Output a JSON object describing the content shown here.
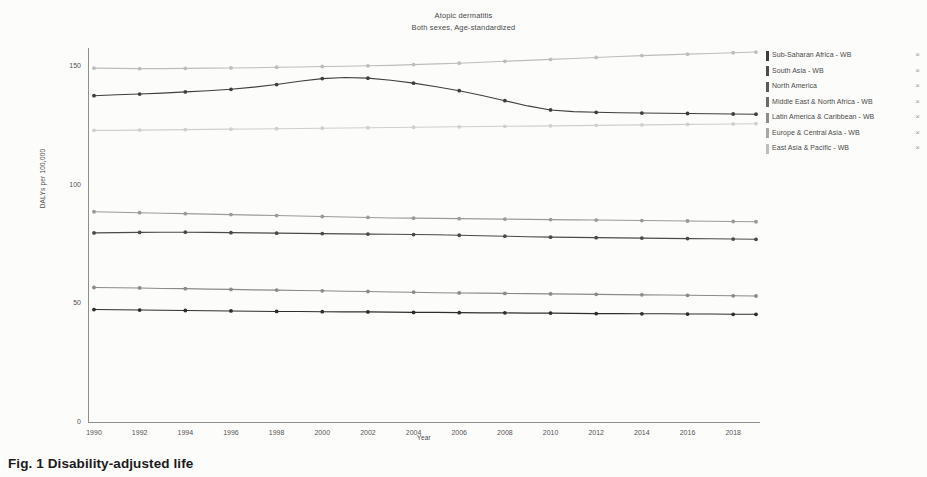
{
  "figure": {
    "title": "Atopic dermatitis",
    "subtitle": "Both sexes, Age-standardized",
    "caption": "Fig. 1  Disability-adjusted life"
  },
  "axes": {
    "y_label": "DALYs per 100,000",
    "x_label": "Year",
    "y_ticks": [
      "0",
      "50",
      "100",
      "150"
    ],
    "x_ticks": [
      "1990",
      "1992",
      "1994",
      "1996",
      "1998",
      "2000",
      "2002",
      "2004",
      "2006",
      "2008",
      "2010",
      "2012",
      "2014",
      "2016",
      "2018"
    ]
  },
  "legend": {
    "items": [
      {
        "label": "Sub-Saharan Africa - WB",
        "color": "#3f3f3f",
        "close": "×"
      },
      {
        "label": "South Asia - WB",
        "color": "#4d4d4d",
        "close": "×"
      },
      {
        "label": "North America",
        "color": "#5a5a5a",
        "close": "×"
      },
      {
        "label": "Middle East & North Africa - WB",
        "color": "#6b6b6b",
        "close": "×"
      },
      {
        "label": "Latin America & Caribbean - WB",
        "color": "#8c8c8c",
        "close": "×"
      },
      {
        "label": "Europe & Central Asia - WB",
        "color": "#a8a8a8",
        "close": "×"
      },
      {
        "label": "East Asia & Pacific - WB",
        "color": "#bdbdbd",
        "close": "×"
      }
    ]
  },
  "chart_data": {
    "type": "line",
    "title": "Atopic dermatitis",
    "subtitle": "Both sexes, Age-standardized",
    "xlabel": "Year",
    "ylabel": "DALYs per 100,000",
    "xlim": [
      1990,
      2019
    ],
    "ylim": [
      0,
      158
    ],
    "y_ticks": [
      0,
      50,
      100,
      150
    ],
    "x_ticks": [
      1990,
      1992,
      1994,
      1996,
      1998,
      2000,
      2002,
      2004,
      2006,
      2008,
      2010,
      2012,
      2014,
      2016,
      2018
    ],
    "grid": false,
    "legend_position": "right",
    "x": [
      1990,
      1991,
      1992,
      1993,
      1994,
      1995,
      1996,
      1997,
      1998,
      1999,
      2000,
      2001,
      2002,
      2003,
      2004,
      2005,
      2006,
      2007,
      2008,
      2009,
      2010,
      2011,
      2012,
      2013,
      2014,
      2015,
      2016,
      2017,
      2018,
      2019
    ],
    "series": [
      {
        "name": "East Asia & Pacific - WB",
        "color": "#bdbdbd",
        "values": [
          149.5,
          149.4,
          149.3,
          149.3,
          149.4,
          149.5,
          149.6,
          149.7,
          149.9,
          150.0,
          150.2,
          150.3,
          150.5,
          150.7,
          151.0,
          151.3,
          151.6,
          152.0,
          152.4,
          152.8,
          153.2,
          153.6,
          154.0,
          154.4,
          154.8,
          155.1,
          155.4,
          155.7,
          156.0,
          156.3
        ]
      },
      {
        "name": "Sub-Saharan Africa - WB",
        "color": "#3f3f3f",
        "values": [
          137.9,
          138.3,
          138.6,
          139.0,
          139.5,
          140.0,
          140.6,
          141.5,
          142.6,
          144.0,
          145.1,
          145.6,
          145.3,
          144.4,
          143.2,
          141.7,
          140.0,
          138.0,
          135.8,
          133.6,
          131.9,
          131.2,
          130.9,
          130.7,
          130.6,
          130.5,
          130.4,
          130.3,
          130.2,
          130.1
        ]
      },
      {
        "name": "Europe & Central Asia - WB",
        "color": "#cfcfcf",
        "values": [
          123.3,
          123.3,
          123.4,
          123.5,
          123.6,
          123.7,
          123.8,
          123.9,
          124.0,
          124.1,
          124.2,
          124.3,
          124.4,
          124.5,
          124.6,
          124.7,
          124.8,
          124.9,
          125.0,
          125.1,
          125.2,
          125.3,
          125.4,
          125.5,
          125.6,
          125.7,
          125.8,
          125.9,
          126.0,
          126.1
        ]
      },
      {
        "name": "Latin America & Caribbean - WB",
        "color": "#9a9a9a",
        "values": [
          89.0,
          88.8,
          88.6,
          88.4,
          88.2,
          88.0,
          87.8,
          87.6,
          87.4,
          87.2,
          87.0,
          86.8,
          86.6,
          86.4,
          86.3,
          86.2,
          86.1,
          86.0,
          85.9,
          85.8,
          85.7,
          85.6,
          85.5,
          85.4,
          85.3,
          85.2,
          85.1,
          85.0,
          84.9,
          84.8
        ]
      },
      {
        "name": "Middle East & North Africa - WB",
        "color": "#4a4a4a",
        "values": [
          80.1,
          80.2,
          80.3,
          80.4,
          80.4,
          80.3,
          80.2,
          80.1,
          80.0,
          79.9,
          79.8,
          79.7,
          79.6,
          79.5,
          79.4,
          79.3,
          79.1,
          78.9,
          78.7,
          78.5,
          78.3,
          78.2,
          78.1,
          78.0,
          77.9,
          77.8,
          77.7,
          77.6,
          77.5,
          77.4
        ]
      },
      {
        "name": "North America",
        "color": "#8a8a8a",
        "values": [
          57.1,
          57.0,
          56.9,
          56.7,
          56.6,
          56.4,
          56.3,
          56.1,
          56.0,
          55.8,
          55.7,
          55.5,
          55.4,
          55.2,
          55.1,
          54.9,
          54.8,
          54.7,
          54.6,
          54.5,
          54.4,
          54.3,
          54.2,
          54.1,
          54.0,
          53.9,
          53.8,
          53.7,
          53.6,
          53.5
        ]
      },
      {
        "name": "South Asia - WB",
        "color": "#2e2e2e",
        "values": [
          47.8,
          47.7,
          47.6,
          47.5,
          47.4,
          47.3,
          47.2,
          47.1,
          47.0,
          47.0,
          46.9,
          46.8,
          46.8,
          46.7,
          46.6,
          46.6,
          46.5,
          46.4,
          46.4,
          46.3,
          46.3,
          46.2,
          46.1,
          46.1,
          46.0,
          46.0,
          45.9,
          45.9,
          45.8,
          45.8
        ]
      }
    ]
  }
}
